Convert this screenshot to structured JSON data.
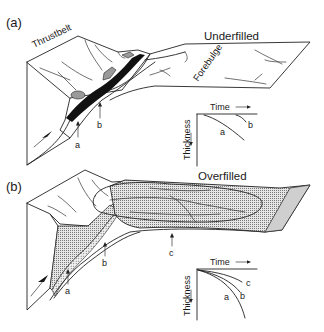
{
  "figure": {
    "panels": [
      {
        "id": "a",
        "panel_label": "(a)",
        "title": "Underfilled",
        "region_labels": {
          "thrustbelt": "Thrustbelt",
          "forebulge": "Forebulge"
        },
        "point_labels": [
          "a",
          "b"
        ],
        "inset": {
          "x_label": "Time",
          "y_label": "Thickness",
          "curve_labels": [
            "a",
            "b"
          ]
        }
      },
      {
        "id": "b",
        "panel_label": "(b)",
        "title": "Overfilled",
        "point_labels": [
          "a",
          "b",
          "c"
        ],
        "inset": {
          "x_label": "Time",
          "y_label": "Thickness",
          "curve_labels": [
            "a",
            "b",
            "c"
          ]
        }
      }
    ],
    "colors": {
      "line": "#222222",
      "fill_black": "#111111",
      "fill_gray": "#9a9a9a",
      "fill_hatch": "#bdbdbd"
    }
  }
}
